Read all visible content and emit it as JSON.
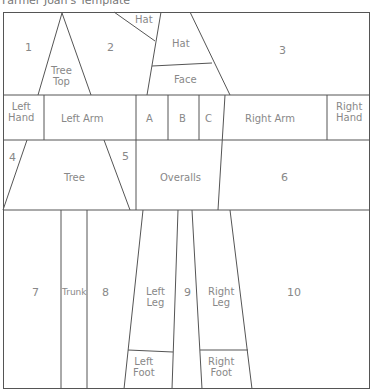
{
  "title": "Farmer Joan's Template",
  "colors": {
    "line": "#555555",
    "text": "#888888",
    "background": "#ffffff"
  },
  "pieces": {
    "p1": "1",
    "p2": "2",
    "p3": "3",
    "p4": "4",
    "p5": "5",
    "p6": "6",
    "p7": "7",
    "p8": "8",
    "p9": "9",
    "p10": "10",
    "tree_top": "Tree Top",
    "tree_top_l1": "Tree",
    "tree_top_l2": "Top",
    "hat_small": "Hat",
    "hat": "Hat",
    "face": "Face",
    "left_hand_l1": "Left",
    "left_hand_l2": "Hand",
    "left_arm": "Left Arm",
    "a": "A",
    "b": "B",
    "c": "C",
    "right_arm": "Right Arm",
    "right_hand_l1": "Right",
    "right_hand_l2": "Hand",
    "tree": "Tree",
    "overalls": "Overalls",
    "trunk": "Trunk",
    "left_leg_l1": "Left",
    "left_leg_l2": "Leg",
    "right_leg_l1": "Right",
    "right_leg_l2": "Leg",
    "left_foot_l1": "Left",
    "left_foot_l2": "Foot",
    "right_foot_l1": "Right",
    "right_foot_l2": "Foot"
  }
}
